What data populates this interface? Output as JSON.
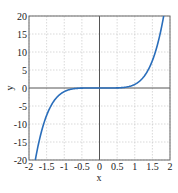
{
  "chart_data": {
    "type": "line",
    "title": "",
    "xlabel": "x",
    "ylabel": "y",
    "xlim": [
      -2,
      2
    ],
    "ylim": [
      -20,
      20
    ],
    "grid": true,
    "x_ticks": [
      "-2",
      "-1.5",
      "-1",
      "-0.5",
      "0",
      "0.5",
      "1",
      "1.5",
      "2"
    ],
    "y_ticks": [
      "20",
      "15",
      "10",
      "5",
      "0",
      "-5",
      "-10",
      "-15",
      "-20"
    ],
    "series": [
      {
        "name": "y = x^5",
        "color": "#2a6ebb",
        "x": [
          -1.82,
          -1.75,
          -1.5,
          -1.25,
          -1.0,
          -0.75,
          -0.5,
          -0.25,
          0,
          0.25,
          0.5,
          0.75,
          1.0,
          1.25,
          1.5,
          1.75,
          1.82
        ],
        "y": [
          -20.0,
          -16.4,
          -7.6,
          -3.1,
          -1.0,
          -0.24,
          -0.03,
          0.0,
          0,
          0.0,
          0.03,
          0.24,
          1.0,
          3.1,
          7.6,
          16.4,
          20.0
        ]
      }
    ]
  },
  "labels": {
    "x": "x",
    "y": "y"
  }
}
